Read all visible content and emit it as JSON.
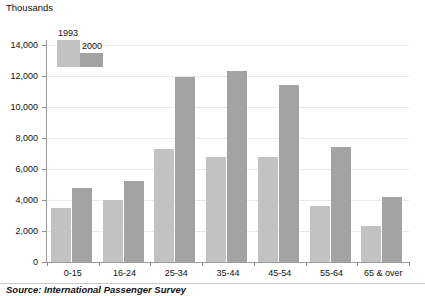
{
  "chart_data": {
    "type": "bar",
    "title": "",
    "unit_label": "Thousands",
    "xlabel": "",
    "ylabel": "",
    "ylim": [
      0,
      14000
    ],
    "ytick_step": 2000,
    "ytick_labels": [
      "0",
      "2,000",
      "4,000",
      "6,000",
      "8,000",
      "10,000",
      "12,000",
      "14,000"
    ],
    "ytick_values": [
      0,
      2000,
      4000,
      6000,
      8000,
      10000,
      12000,
      14000
    ],
    "grid": true,
    "legend_position": "top-left",
    "categories": [
      "0-15",
      "16-24",
      "25-34",
      "35-44",
      "45-54",
      "55-64",
      "65 & over"
    ],
    "series": [
      {
        "name": "1993",
        "color": "#c2c2c2",
        "values": [
          3500,
          4000,
          7300,
          6800,
          6800,
          3600,
          2300
        ]
      },
      {
        "name": "2000",
        "color": "#a3a3a3",
        "values": [
          4750,
          5200,
          11950,
          12350,
          11400,
          7400,
          4200
        ]
      }
    ],
    "source": "Source: International Passenger Survey"
  }
}
